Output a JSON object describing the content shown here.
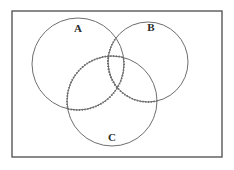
{
  "diagram": {
    "type": "venn-diagram",
    "background_color": "#ffffff",
    "stroke_color": "#585858",
    "label_color": "#2b2b2b",
    "highlight_color": "#6b6b6b",
    "universe": {
      "name": "universal-set-rectangle",
      "x": 12,
      "y": 11,
      "width": 210,
      "height": 146,
      "stroke_width": 1.4
    },
    "sets": [
      {
        "id": "A",
        "label": "A",
        "cx": 78,
        "cy": 64,
        "r": 46,
        "label_x": 78,
        "label_y": 29,
        "stroke_width": 1.0
      },
      {
        "id": "B",
        "label": "B",
        "cx": 148,
        "cy": 62,
        "r": 40,
        "label_x": 151,
        "label_y": 28,
        "stroke_width": 1.0
      },
      {
        "id": "C",
        "label": "C",
        "cx": 112,
        "cy": 101,
        "r": 45,
        "label_x": 112,
        "label_y": 138,
        "stroke_width": 1.0
      }
    ],
    "highlight": {
      "name": "shaded-intersection-boundary",
      "description": "Dotted boundary marking the A intersect C region extended through the triple intersection",
      "dash_pattern": "1.2 1.6",
      "stroke_width": 1.8
    }
  }
}
